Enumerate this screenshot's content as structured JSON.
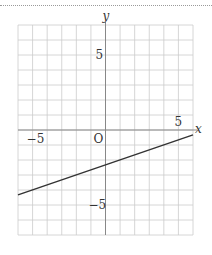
{
  "chart_data": {
    "type": "line",
    "title": "",
    "xlabel": "x",
    "ylabel": "y",
    "xlim": [
      -6,
      6
    ],
    "ylim": [
      -7,
      7
    ],
    "grid": true,
    "origin_label": "O",
    "x_tick_labels": [
      {
        "value": -5,
        "label": "−5"
      },
      {
        "value": 5,
        "label": "5"
      }
    ],
    "y_tick_labels": [
      {
        "value": 5,
        "label": "5"
      },
      {
        "value": -5,
        "label": "−5"
      }
    ],
    "series": [
      {
        "name": "line",
        "x": [
          -6,
          6
        ],
        "y": [
          -4.33,
          -0.33
        ],
        "equation": "y = (x - 7)/3"
      }
    ]
  },
  "colors": {
    "grid": "#cccccc",
    "axis": "#888888",
    "line": "#333333",
    "text": "#333333"
  }
}
